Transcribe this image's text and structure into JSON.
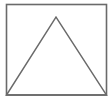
{
  "diagram": {
    "stroke_color": "#6a6a6a",
    "background": "#ffffff",
    "rectangle": {
      "x": 6.5,
      "y": 4.5,
      "width": 100,
      "height": 90.5
    },
    "triangle": {
      "points": [
        [
          6.5,
          95
        ],
        [
          56,
          17
        ],
        [
          106.5,
          95
        ]
      ]
    }
  }
}
